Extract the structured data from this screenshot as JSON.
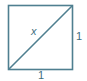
{
  "figure": {
    "shape": "square",
    "stroke_color": "#4f7f90",
    "diagonal_label": "x",
    "side_right_label": "1",
    "side_bottom_label": "1"
  }
}
